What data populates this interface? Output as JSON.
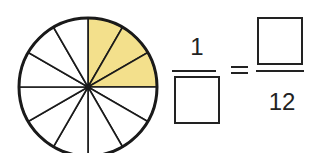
{
  "diagram": {
    "circle": {
      "sectors": 12,
      "shaded_sectors": 3,
      "shade_color": "#f3e08c",
      "line_color": "#1a1a1a"
    },
    "equation": {
      "left_numerator": "1",
      "left_denominator": "",
      "equals": "=",
      "right_numerator": "",
      "right_denominator": "12"
    }
  }
}
